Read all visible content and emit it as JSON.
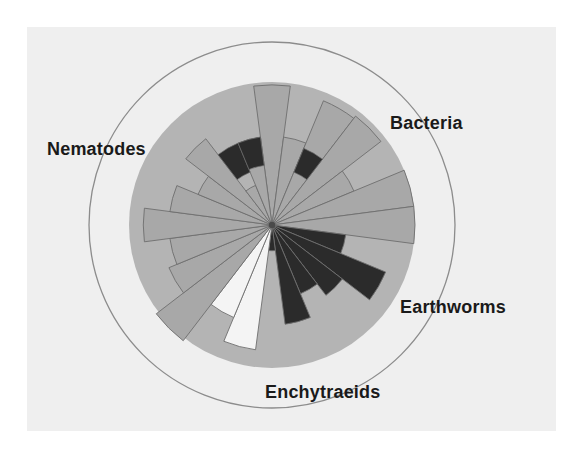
{
  "figure": {
    "title": "",
    "background_color": "#efefef",
    "page_color": "#ffffff"
  },
  "labels": {
    "bacteria": "Bacteria",
    "nematodes": "Nematodes",
    "earthworms": "Earthworms",
    "enchytraeids": "Enchytraeids"
  },
  "colors": {
    "wedge_grey": "#a8a8a8",
    "wedge_dark": "#2b2b2b",
    "wedge_white": "#f4f4f4",
    "wedge_outline": "#6e6e6e",
    "disc_grey": "#b4b4b4",
    "outer_ring": "#8c8c8c",
    "panel": "#efefef",
    "text": "#1a1a1a"
  },
  "chart_data": {
    "type": "pie",
    "title": "",
    "subtype": "polar-rose / wind-rose",
    "center_px": [
      272,
      225
    ],
    "disc_radius_px": 143,
    "outer_ring_radius_px": 183,
    "sector_count": 24,
    "sector_degrees": 15,
    "angle_reference": "0 deg = up (12 o'clock), increasing clockwise",
    "rmax": 1.0,
    "grid": false,
    "legend": "none",
    "xlabel": "",
    "ylabel": "",
    "category_labels": [
      "Bacteria",
      "Nematodes",
      "Earthworms",
      "Enchytraeids"
    ],
    "category_label_angles_deg": [
      52,
      305,
      125,
      185
    ],
    "tones": {
      "grey": "#a8a8a8",
      "dark": "#2b2b2b",
      "white": "#f4f4f4"
    },
    "sectors": [
      {
        "i": 0,
        "angle_deg": 0,
        "radius": 0.98,
        "tone": "grey"
      },
      {
        "i": 1,
        "angle_deg": 15,
        "radius": 0.62,
        "tone": "grey"
      },
      {
        "i": 2,
        "angle_deg": 30,
        "radius": 0.94,
        "tone": "grey"
      },
      {
        "i": 3,
        "angle_deg": 45,
        "radius": 0.96,
        "tone": "grey"
      },
      {
        "i": 4,
        "angle_deg": 60,
        "radius": 0.62,
        "tone": "grey"
      },
      {
        "i": 5,
        "angle_deg": 75,
        "radius": 1.0,
        "tone": "grey"
      },
      {
        "i": 6,
        "angle_deg": 90,
        "radius": 1.0,
        "tone": "grey"
      },
      {
        "i": 7,
        "angle_deg": 105,
        "radius": 0.52,
        "tone": "dark"
      },
      {
        "i": 8,
        "angle_deg": 120,
        "radius": 0.86,
        "tone": "dark"
      },
      {
        "i": 9,
        "angle_deg": 135,
        "radius": 0.62,
        "tone": "dark"
      },
      {
        "i": 10,
        "angle_deg": 150,
        "radius": 0.52,
        "tone": "dark"
      },
      {
        "i": 11,
        "angle_deg": 165,
        "radius": 0.7,
        "tone": "dark"
      },
      {
        "i": 12,
        "angle_deg": 180,
        "radius": 0.18,
        "tone": "dark"
      },
      {
        "i": 13,
        "angle_deg": 195,
        "radius": 0.88,
        "tone": "white"
      },
      {
        "i": 14,
        "angle_deg": 210,
        "radius": 0.7,
        "tone": "white"
      },
      {
        "i": 15,
        "angle_deg": 225,
        "radius": 1.02,
        "tone": "grey"
      },
      {
        "i": 16,
        "angle_deg": 240,
        "radius": 0.78,
        "tone": "grey"
      },
      {
        "i": 17,
        "angle_deg": 255,
        "radius": 0.72,
        "tone": "grey"
      },
      {
        "i": 18,
        "angle_deg": 270,
        "radius": 0.9,
        "tone": "grey"
      },
      {
        "i": 19,
        "angle_deg": 285,
        "radius": 0.72,
        "tone": "grey"
      },
      {
        "i": 20,
        "angle_deg": 300,
        "radius": 0.56,
        "tone": "grey"
      },
      {
        "i": 21,
        "angle_deg": 315,
        "radius": 0.76,
        "tone": "grey"
      },
      {
        "i": 22,
        "angle_deg": 330,
        "radius": 0.3,
        "tone": "grey"
      },
      {
        "i": 23,
        "angle_deg": 345,
        "radius": 0.62,
        "tone": "grey"
      }
    ],
    "inner_dark_blocks": [
      {
        "angle_deg": 330,
        "r0": 0.4,
        "r1": 0.62,
        "tone": "dark"
      },
      {
        "angle_deg": 345,
        "r0": 0.42,
        "r1": 0.62,
        "tone": "dark"
      },
      {
        "angle_deg": 30,
        "r0": 0.4,
        "r1": 0.58,
        "tone": "dark"
      }
    ]
  }
}
